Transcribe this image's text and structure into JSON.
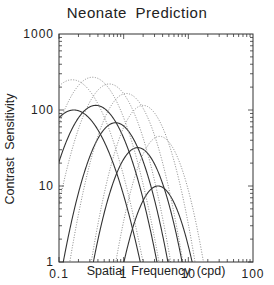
{
  "chart_data": {
    "type": "line",
    "title": "Neonate Prediction",
    "xlabel": "Spatial Frequency (cpd)",
    "ylabel": "Contrast Sensitivity",
    "xscale": "log",
    "yscale": "log",
    "xlim": [
      0.1,
      100
    ],
    "ylim": [
      1,
      1000
    ],
    "xticks": [
      "0.1",
      "1",
      "10",
      "100"
    ],
    "yticks": [
      "1",
      "10",
      "100",
      "1000"
    ],
    "grid": false,
    "legend": null,
    "series": [
      {
        "name": "solid-1",
        "style": "solid",
        "peak_freq": 0.17,
        "peak_sensitivity": 100,
        "width_k": 1.9
      },
      {
        "name": "solid-2",
        "style": "solid",
        "peak_freq": 0.37,
        "peak_sensitivity": 115,
        "width_k": 2.3
      },
      {
        "name": "solid-3",
        "style": "solid",
        "peak_freq": 0.75,
        "peak_sensitivity": 68,
        "width_k": 2.8
      },
      {
        "name": "solid-4",
        "style": "solid",
        "peak_freq": 1.65,
        "peak_sensitivity": 32,
        "width_k": 3.2
      },
      {
        "name": "solid-5",
        "style": "solid",
        "peak_freq": 3.4,
        "peak_sensitivity": 10,
        "width_k": 3.6
      },
      {
        "name": "dotted-1",
        "style": "dotted",
        "peak_freq": 0.16,
        "peak_sensitivity": 250,
        "width_k": 2.0
      },
      {
        "name": "dotted-2",
        "style": "dotted",
        "peak_freq": 0.33,
        "peak_sensitivity": 270,
        "width_k": 2.3
      },
      {
        "name": "dotted-3",
        "style": "dotted",
        "peak_freq": 0.6,
        "peak_sensitivity": 220,
        "width_k": 2.6
      },
      {
        "name": "dotted-4",
        "style": "dotted",
        "peak_freq": 1.1,
        "peak_sensitivity": 165,
        "width_k": 2.9
      },
      {
        "name": "dotted-5",
        "style": "dotted",
        "peak_freq": 2.0,
        "peak_sensitivity": 115,
        "width_k": 3.2
      },
      {
        "name": "dotted-6",
        "style": "dotted",
        "peak_freq": 3.6,
        "peak_sensitivity": 45,
        "width_k": 3.6
      }
    ]
  },
  "plot": {
    "left": 59,
    "top": 34,
    "right": 253,
    "bottom": 262,
    "axis_color": "#333333",
    "solid_color": "#333333",
    "dotted_color": "#888888"
  }
}
